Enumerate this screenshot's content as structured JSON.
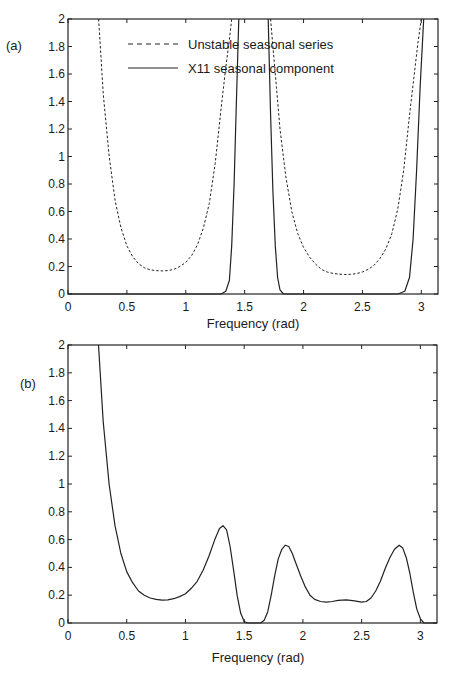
{
  "chart_data": [
    {
      "type": "line",
      "panel_label": "(a)",
      "xlabel": "Frequency (rad)",
      "ylabel": "",
      "xlim": [
        0,
        3.1416
      ],
      "ylim": [
        0,
        2
      ],
      "xticks": [
        0,
        0.5,
        1,
        1.5,
        2,
        2.5,
        3
      ],
      "xtick_labels": [
        "0",
        "0.5",
        "1",
        "1.5",
        "2",
        "2.5",
        "3"
      ],
      "yticks": [
        0,
        0.2,
        0.4,
        0.6,
        0.8,
        1,
        1.2,
        1.4,
        1.6,
        1.8,
        2
      ],
      "ytick_labels": [
        "0",
        "0.2",
        "0.4",
        "0.6",
        "0.8",
        "1",
        "1.2",
        "1.4",
        "1.6",
        "1.8",
        "2"
      ],
      "grid": false,
      "legend_position": "top-center",
      "series": [
        {
          "name": "Unstable seasonal series",
          "style": "dashed",
          "segments": [
            {
              "x": [
                0.26,
                0.3,
                0.35,
                0.4,
                0.45,
                0.5,
                0.55,
                0.6,
                0.65,
                0.7,
                0.75,
                0.8,
                0.85,
                0.9,
                0.95,
                1.0,
                1.05,
                1.1,
                1.15,
                1.2,
                1.25,
                1.3,
                1.34,
                1.37,
                1.39
              ],
              "y": [
                2.0,
                1.45,
                1.0,
                0.68,
                0.48,
                0.35,
                0.27,
                0.22,
                0.19,
                0.175,
                0.17,
                0.168,
                0.17,
                0.18,
                0.2,
                0.23,
                0.28,
                0.36,
                0.48,
                0.66,
                0.95,
                1.35,
                1.65,
                1.85,
                2.0
              ]
            },
            {
              "x": [
                1.72,
                1.74,
                1.77,
                1.8,
                1.85,
                1.9,
                1.95,
                2.0,
                2.05,
                2.1,
                2.15,
                2.2,
                2.25,
                2.3,
                2.35,
                2.4,
                2.45,
                2.5,
                2.55,
                2.6,
                2.65,
                2.7,
                2.75,
                2.8,
                2.85,
                2.9,
                2.94,
                2.97,
                3.0
              ],
              "y": [
                2.0,
                1.8,
                1.5,
                1.2,
                0.85,
                0.6,
                0.44,
                0.34,
                0.27,
                0.22,
                0.18,
                0.16,
                0.15,
                0.145,
                0.142,
                0.143,
                0.148,
                0.16,
                0.18,
                0.21,
                0.26,
                0.33,
                0.44,
                0.62,
                0.9,
                1.3,
                1.6,
                1.82,
                2.0
              ]
            }
          ]
        },
        {
          "name": "X11 seasonal component",
          "style": "solid",
          "segments": [
            {
              "x": [
                0.0,
                1.3,
                1.34,
                1.37,
                1.39,
                1.41,
                1.43,
                1.45
              ],
              "y": [
                0.0,
                0.0,
                0.02,
                0.1,
                0.35,
                0.8,
                1.4,
                2.0
              ]
            },
            {
              "x": [
                1.7,
                1.72,
                1.74,
                1.76,
                1.78,
                1.8,
                1.83,
                2.8,
                2.86,
                2.9,
                2.93,
                2.96,
                2.99,
                3.02
              ],
              "y": [
                2.0,
                1.3,
                0.75,
                0.35,
                0.12,
                0.03,
                0.0,
                0.0,
                0.02,
                0.12,
                0.4,
                0.9,
                1.5,
                2.0
              ]
            }
          ]
        }
      ]
    },
    {
      "type": "line",
      "panel_label": "(b)",
      "xlabel": "Frequency (rad)",
      "ylabel": "",
      "xlim": [
        0,
        3.1416
      ],
      "ylim": [
        0,
        2
      ],
      "xticks": [
        0,
        0.5,
        1,
        1.5,
        2,
        2.5,
        3
      ],
      "xtick_labels": [
        "0",
        "0.5",
        "1",
        "1.5",
        "2",
        "2.5",
        "3"
      ],
      "yticks": [
        0,
        0.2,
        0.4,
        0.6,
        0.8,
        1,
        1.2,
        1.4,
        1.6,
        1.8,
        2
      ],
      "ytick_labels": [
        "0",
        "0.2",
        "0.4",
        "0.6",
        "0.8",
        "1",
        "1.2",
        "1.4",
        "1.6",
        "1.8",
        "2"
      ],
      "grid": false,
      "legend_position": "none",
      "series": [
        {
          "name": "ratio",
          "style": "solid",
          "segments": [
            {
              "x": [
                0.26,
                0.3,
                0.35,
                0.4,
                0.45,
                0.5,
                0.55,
                0.6,
                0.65,
                0.7,
                0.75,
                0.8,
                0.85,
                0.9,
                0.95,
                1.0,
                1.05,
                1.1,
                1.15,
                1.2,
                1.25,
                1.29,
                1.32,
                1.35,
                1.38,
                1.41,
                1.44,
                1.47,
                1.5,
                1.53,
                1.56,
                1.6,
                1.64,
                1.67,
                1.7,
                1.73,
                1.76,
                1.79,
                1.82,
                1.85,
                1.88,
                1.91,
                1.94,
                1.98,
                2.02,
                2.06,
                2.1,
                2.15,
                2.2,
                2.25,
                2.3,
                2.37,
                2.44,
                2.5,
                2.54,
                2.58,
                2.62,
                2.66,
                2.7,
                2.74,
                2.78,
                2.82,
                2.85,
                2.88,
                2.91,
                2.94,
                2.97,
                3.0,
                3.03,
                3.06,
                3.1,
                3.14
              ],
              "y": [
                2.0,
                1.45,
                1.0,
                0.7,
                0.5,
                0.37,
                0.29,
                0.23,
                0.2,
                0.18,
                0.17,
                0.165,
                0.167,
                0.175,
                0.19,
                0.21,
                0.25,
                0.3,
                0.38,
                0.48,
                0.6,
                0.68,
                0.7,
                0.67,
                0.55,
                0.38,
                0.2,
                0.07,
                0.01,
                0.0,
                0.0,
                0.0,
                0.0,
                0.02,
                0.08,
                0.2,
                0.34,
                0.46,
                0.53,
                0.56,
                0.55,
                0.5,
                0.43,
                0.34,
                0.26,
                0.2,
                0.17,
                0.155,
                0.15,
                0.155,
                0.163,
                0.167,
                0.16,
                0.15,
                0.155,
                0.18,
                0.23,
                0.3,
                0.39,
                0.47,
                0.53,
                0.56,
                0.54,
                0.47,
                0.36,
                0.22,
                0.1,
                0.03,
                0.0,
                0.0,
                0.0,
                0.0
              ]
            }
          ]
        }
      ]
    }
  ],
  "panels": [
    {
      "label": "(a)",
      "xlabel": "Frequency (rad)",
      "legend": [
        {
          "label": "Unstable seasonal series"
        },
        {
          "label": "X11 seasonal component"
        }
      ]
    },
    {
      "label": "(b)",
      "xlabel": "Frequency (rad)"
    }
  ]
}
